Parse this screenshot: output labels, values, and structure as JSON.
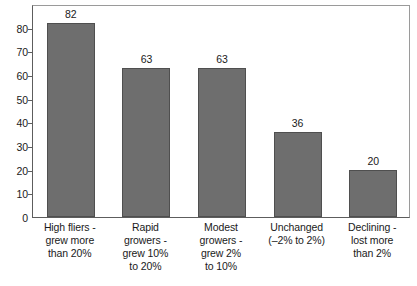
{
  "chart_data": {
    "type": "bar",
    "title": "",
    "subtitle": "",
    "xlabel": "",
    "ylabel": "",
    "ylim": [
      0,
      90
    ],
    "grid": false,
    "legend": false,
    "orientation": "vertical",
    "bar_color": "#6e6e6e",
    "bar_border_color": "#4f4f4f",
    "axis_color": "#5d5d5d",
    "frame_color": "#9a9a9a",
    "text_color": "#1a1a1a",
    "background": "#ffffff",
    "categories": [
      "High fliers - grew more than 20%",
      "Rapid growers - grew 10% to 20%",
      "Modest growers - grew 2% to 10%",
      "Unchanged (–2% to 2%)",
      "Declining - lost more than 2%"
    ],
    "category_lines": [
      [
        "High fliers -",
        "grew more",
        "than 20%"
      ],
      [
        "Rapid",
        "growers -",
        "grew 10%",
        "to 20%"
      ],
      [
        "Modest",
        "growers -",
        "grew 2%",
        "to 10%"
      ],
      [
        "Unchanged",
        "(–2% to 2%)"
      ],
      [
        "Declining -",
        "lost more",
        "than 2%"
      ]
    ],
    "values": [
      82,
      63,
      63,
      36,
      20
    ],
    "value_labels": [
      "82",
      "63",
      "63",
      "36",
      "20"
    ],
    "yticks": [
      0,
      10,
      20,
      30,
      40,
      50,
      60,
      70,
      80
    ],
    "ytick_labels": [
      "0",
      "10",
      "20",
      "30",
      "40",
      "50",
      "60",
      "70",
      "80"
    ]
  }
}
